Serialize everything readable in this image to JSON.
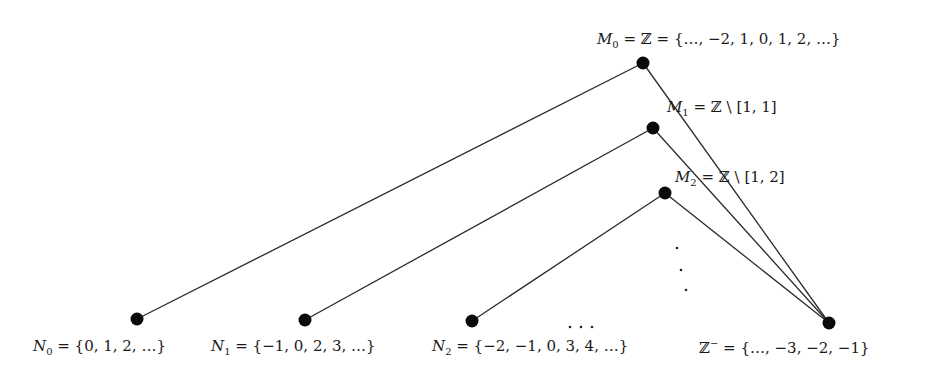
{
  "diagram": {
    "type": "hasse-like set diagram",
    "colors": {
      "line": "#2a2a2a",
      "node": "#0a0a0a",
      "text": "#1a1a1a",
      "background": "#ffffff"
    },
    "nodes": [
      {
        "id": "M0",
        "x": 643,
        "y": 63,
        "label": "M₀ = ℤ = {…, −2, 1, 0, 1, 2, …}"
      },
      {
        "id": "M1",
        "x": 653,
        "y": 128,
        "label": "M₁ = ℤ \\ [1, 1]"
      },
      {
        "id": "M2",
        "x": 665,
        "y": 193,
        "label": "M₂ = ℤ \\ [1, 2]"
      },
      {
        "id": "N0",
        "x": 137,
        "y": 319,
        "label": "N₀ = {0, 1, 2, …}"
      },
      {
        "id": "N1",
        "x": 305,
        "y": 320,
        "label": "N₁ = {−1, 0, 2, 3, …}"
      },
      {
        "id": "N2",
        "x": 472,
        "y": 321,
        "label": "N₂ = {−2, −1, 0, 3, 4, …}"
      },
      {
        "id": "Zminus",
        "x": 829,
        "y": 323,
        "label": "ℤ⁻ = {…, −3, −2, −1}"
      }
    ],
    "edges": [
      [
        "M0",
        "N0"
      ],
      [
        "M1",
        "N1"
      ],
      [
        "M2",
        "N2"
      ],
      [
        "M0",
        "Zminus"
      ],
      [
        "M1",
        "Zminus"
      ],
      [
        "M2",
        "Zminus"
      ]
    ],
    "ellipsis_vertical": "⋮",
    "ellipsis_horizontal": "…"
  }
}
